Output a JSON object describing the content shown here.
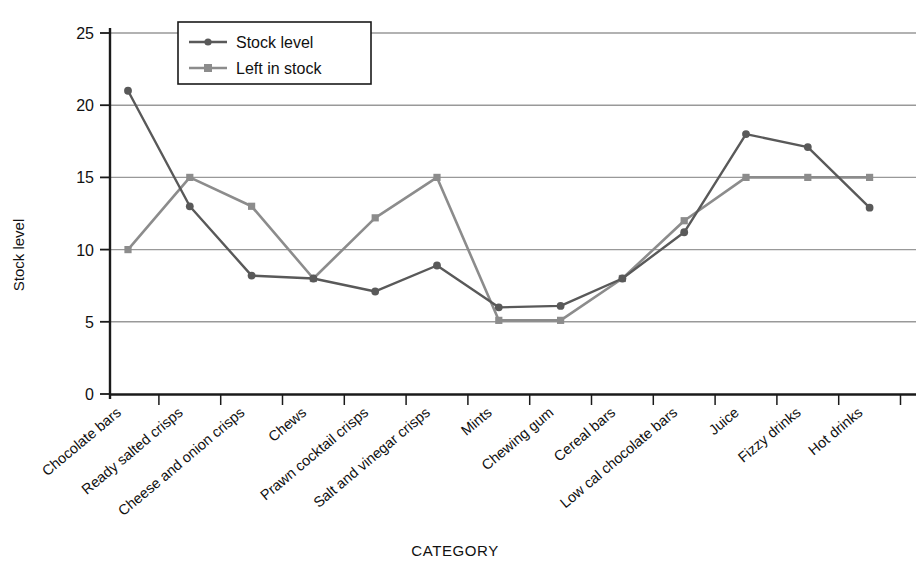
{
  "chart_data": {
    "type": "line",
    "title": "",
    "xlabel": "CATEGORY",
    "ylabel": "Stock level",
    "ylim": [
      0,
      25
    ],
    "yticks": [
      0,
      5,
      10,
      15,
      20,
      25
    ],
    "grid": true,
    "legend_position": "top-left-inside",
    "categories": [
      "Chocolate bars",
      "Ready salted crisps",
      "Cheese and onion crisps",
      "Chews",
      "Prawn cocktail crisps",
      "Salt and vinegar crisps",
      "Mints",
      "Chewing gum",
      "Cereal bars",
      "Low cal chocolate bars",
      "Juice",
      "Fizzy drinks",
      "Hot drinks"
    ],
    "series": [
      {
        "name": "Stock level",
        "color": "#595959",
        "marker": "circle",
        "values": [
          21,
          13,
          8.2,
          8,
          7.1,
          8.9,
          6,
          6.1,
          8,
          11.2,
          18,
          17.1,
          12.9
        ]
      },
      {
        "name": "Left in stock",
        "color": "#8c8c8c",
        "marker": "square",
        "values": [
          10,
          15,
          13,
          8,
          12.2,
          15,
          5.1,
          5.1,
          8,
          12,
          15,
          15,
          15
        ]
      }
    ]
  },
  "axis": {
    "y_title": "Stock level",
    "x_title": "CATEGORY",
    "y_tick_labels": [
      "25",
      "20",
      "15",
      "10",
      "5",
      "0"
    ]
  },
  "legend": {
    "entries": [
      {
        "label": "Stock level"
      },
      {
        "label": "Left in stock"
      }
    ]
  },
  "colors": {
    "series_stock_level": "#595959",
    "series_left_in_stock": "#8c8c8c",
    "gridline": "#999999",
    "axis": "#1a1a1a",
    "background": "#ffffff"
  }
}
